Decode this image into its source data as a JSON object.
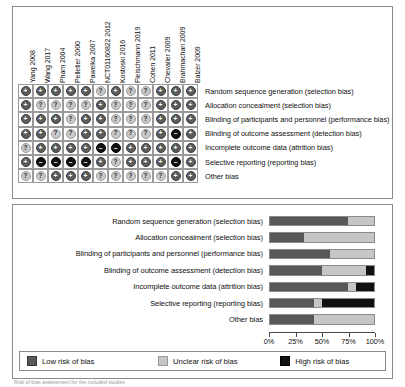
{
  "figure": {
    "caption": "Risk of bias assessment for the included studies"
  },
  "matrix": {
    "studies": [
      "Yang 2008",
      "Wang 2017",
      "Pham 2004",
      "Pelletier 2000",
      "Pawelka 2007",
      "NCT01160822 2012",
      "Kostoski 2016",
      "Fleischmann 2019",
      "Cohen 2011",
      "Chevalier 2009",
      "Brahmachari 2009",
      "Balzer 2009"
    ],
    "domains": [
      "Random sequence generation (selection bias)",
      "Allocation concealment (selection bias)",
      "Blinding of participants and personnel (performance bias)",
      "Blinding of outcome assessment (detection bias)",
      "Incomplete outcome data (attrition bias)",
      "Selective reporting (reporting bias)",
      "Other bias"
    ],
    "symbols": {
      "low": "+",
      "unclear": "?",
      "high": "–"
    },
    "cells": [
      [
        "low",
        "low",
        "low",
        "low",
        "low",
        "unclear",
        "low",
        "unclear",
        "unclear",
        "low",
        "low",
        "low"
      ],
      [
        "low",
        "unclear",
        "unclear",
        "unclear",
        "unclear",
        "low",
        "unclear",
        "unclear",
        "unclear",
        "low",
        "low",
        "low"
      ],
      [
        "low",
        "low",
        "low",
        "unclear",
        "low",
        "low",
        "unclear",
        "unclear",
        "unclear",
        "low",
        "low",
        "low"
      ],
      [
        "low",
        "low",
        "unclear",
        "unclear",
        "low",
        "low",
        "unclear",
        "unclear",
        "unclear",
        "low",
        "high",
        "low"
      ],
      [
        "unclear",
        "low",
        "low",
        "low",
        "low",
        "high",
        "high",
        "low",
        "low",
        "low",
        "low",
        "low"
      ],
      [
        "low",
        "high",
        "high",
        "high",
        "high",
        "low",
        "unclear",
        "low",
        "low",
        "low",
        "high",
        "low"
      ],
      [
        "unclear",
        "unclear",
        "low",
        "low",
        "low",
        "unclear",
        "unclear",
        "unclear",
        "unclear",
        "unclear",
        "low",
        "low"
      ]
    ]
  },
  "chart_data": {
    "type": "bar",
    "orientation": "horizontal-stacked",
    "categories": [
      "Random sequence generation (selection bias)",
      "Allocation concealment (selection bias)",
      "Blinding of participants and personnel (performance bias)",
      "Blinding of outcome assessment (detection bias)",
      "Incomplete outcome data (attrition bias)",
      "Selective reporting (reporting bias)",
      "Other bias"
    ],
    "series": [
      {
        "name": "Low risk of bias",
        "color": "#585858",
        "values": [
          75,
          33,
          58,
          50,
          75,
          42,
          42
        ]
      },
      {
        "name": "Unclear risk of bias",
        "color": "#c6c6c6",
        "values": [
          25,
          67,
          42,
          42,
          8,
          8,
          58
        ]
      },
      {
        "name": "High risk of bias",
        "color": "#111111",
        "values": [
          0,
          0,
          0,
          8,
          17,
          50,
          0
        ]
      }
    ],
    "xlabel": "",
    "ylabel": "",
    "xlim": [
      0,
      100
    ],
    "xticks": [
      0,
      25,
      50,
      75,
      100
    ],
    "xtick_labels": [
      "0%",
      "25%",
      "50%",
      "75%",
      "100%"
    ],
    "grid": false,
    "legend_position": "bottom",
    "legend": [
      "Low risk of bias",
      "Unclear risk of bias",
      "High risk of bias"
    ]
  }
}
